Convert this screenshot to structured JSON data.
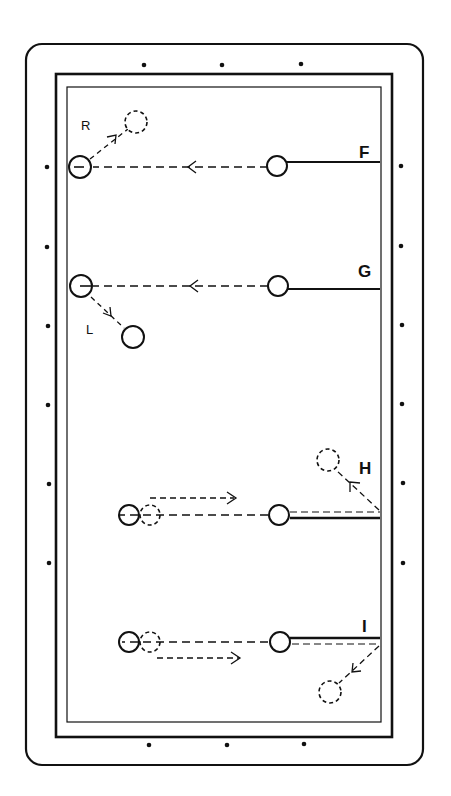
{
  "diagram": {
    "type": "billiards-shot-diagram",
    "colors": {
      "ink": "#111111",
      "background": "#ffffff"
    },
    "table": {
      "outer_frame": {
        "x": 26,
        "y": 44,
        "w": 397,
        "h": 721,
        "radius": 16
      },
      "rail": {
        "x": 56,
        "y": 74,
        "w": 336,
        "h": 663
      },
      "cushion": {
        "x": 67,
        "y": 87,
        "w": 314,
        "h": 635
      },
      "diamonds": {
        "top": [
          [
            144,
            65
          ],
          [
            222,
            65
          ],
          [
            301,
            64
          ]
        ],
        "bottom": [
          [
            149,
            745
          ],
          [
            227,
            745
          ],
          [
            304,
            744
          ]
        ],
        "left": [
          [
            47,
            167
          ],
          [
            47,
            247
          ],
          [
            48,
            326
          ],
          [
            48,
            405
          ],
          [
            49,
            484
          ],
          [
            49,
            563
          ]
        ],
        "right": [
          [
            401,
            166
          ],
          [
            401,
            246
          ],
          [
            402,
            325
          ],
          [
            402,
            404
          ],
          [
            403,
            483
          ],
          [
            403,
            563
          ]
        ]
      }
    },
    "shots": [
      {
        "label": "F",
        "label_pos": [
          365,
          158
        ],
        "cue_ball": [
          277,
          166
        ],
        "object_ball": [
          80,
          167
        ],
        "cue_stick": {
          "from": [
            284,
            162
          ],
          "to": [
            380,
            162
          ],
          "double": false
        },
        "path_arrow_at": [
          190,
          166
        ],
        "deflection": {
          "label": "R",
          "label_pos": [
            81,
            106
          ],
          "ghost_ball": [
            136,
            122
          ],
          "from": [
            90,
            158
          ],
          "arrow_at": [
            111,
            139
          ]
        }
      },
      {
        "label": "G",
        "label_pos": [
          365,
          275
        ],
        "cue_ball": [
          278,
          286
        ],
        "object_ball": [
          81,
          286
        ],
        "cue_stick": {
          "from": [
            285,
            289
          ],
          "to": [
            380,
            289
          ],
          "double": false
        },
        "path_arrow_at": [
          192,
          286
        ],
        "deflection": {
          "label": "L",
          "label_pos": [
            89,
            331
          ],
          "ghost_ball": [
            133,
            337
          ],
          "from": [
            90,
            296
          ],
          "arrow_at": [
            111,
            313
          ],
          "solid": true
        }
      },
      {
        "label": "H",
        "label_pos": [
          366,
          474
        ],
        "cue_ball": [
          279,
          514
        ],
        "object_ball": [
          129,
          515
        ],
        "object_ghost": [
          150,
          515
        ],
        "cue_stick": {
          "from": [
            290,
            517
          ],
          "to": [
            380,
            517
          ],
          "double": true
        },
        "follow_arrow": {
          "from": [
            149,
            498
          ],
          "to": [
            236,
            498
          ]
        },
        "bank": {
          "from": [
            380,
            511
          ],
          "to": [
            338,
            472
          ],
          "arrow_at": [
            352,
            484
          ],
          "ghost_ball": [
            328,
            460
          ]
        }
      },
      {
        "label": "I",
        "label_pos": [
          366,
          629
        ],
        "cue_ball": [
          280,
          642
        ],
        "object_ball": [
          129,
          642
        ],
        "object_ghost": [
          150,
          642
        ],
        "cue_stick": {
          "from": [
            290,
            639
          ],
          "to": [
            380,
            639
          ],
          "double": true
        },
        "draw_arrow": {
          "from": [
            157,
            658
          ],
          "to": [
            241,
            658
          ]
        },
        "bank": {
          "from": [
            380,
            645
          ],
          "to": [
            342,
            680
          ],
          "arrow_at": [
            355,
            669
          ],
          "ghost_ball": [
            330,
            692
          ]
        }
      }
    ],
    "labels": {
      "F": "F",
      "G": "G",
      "H": "H",
      "I": "I",
      "R": "R",
      "L": "L"
    }
  }
}
